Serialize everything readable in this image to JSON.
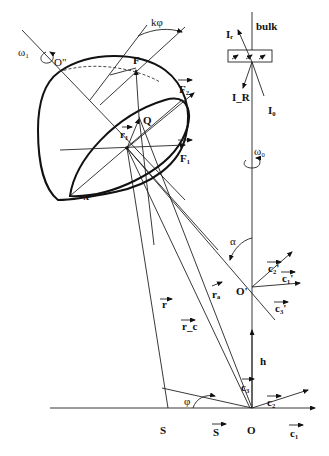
{
  "diagram": {
    "type": "geometric-optics-schematic",
    "colors": {
      "line": "#222222",
      "background": "#ffffff"
    },
    "labels": {
      "omega1": "ω₁",
      "O_double_prime": "O\"",
      "k_phi": "kφ",
      "F": "F",
      "F2": "F₂",
      "Q": "Q",
      "r1": "r₁",
      "F1": "F₁",
      "pi": "π",
      "bulk": "bulk",
      "I_r": "Iᵣ",
      "I_R": "I_R",
      "I_0": "I₀",
      "omega0": "ω₀",
      "alpha": "α",
      "c2_prime": "c₂'",
      "c1_prime": "c₁'",
      "c3_prime": "c₃'",
      "O_prime": "O'",
      "r": "r",
      "r_a": "rₐ",
      "r_c": "r_c",
      "h": "h",
      "c3": "c₃",
      "c2": "c₂",
      "phi": "φ",
      "S_point": "S",
      "S_vec": "S",
      "O": "O",
      "c1": "c₁"
    }
  }
}
